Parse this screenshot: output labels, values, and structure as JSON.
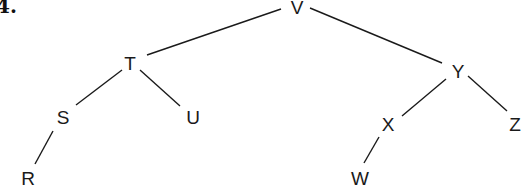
{
  "question_number": "4.",
  "tree": {
    "nodes": [
      {
        "id": "V",
        "label": "V",
        "x": 297,
        "y": 7
      },
      {
        "id": "T",
        "label": "T",
        "x": 130,
        "y": 63
      },
      {
        "id": "Y",
        "label": "Y",
        "x": 458,
        "y": 71
      },
      {
        "id": "S",
        "label": "S",
        "x": 63,
        "y": 117
      },
      {
        "id": "U",
        "label": "U",
        "x": 193,
        "y": 117
      },
      {
        "id": "X",
        "label": "X",
        "x": 388,
        "y": 124
      },
      {
        "id": "Z",
        "label": "Z",
        "x": 515,
        "y": 124
      },
      {
        "id": "R",
        "label": "R",
        "x": 28,
        "y": 178
      },
      {
        "id": "W",
        "label": "W",
        "x": 360,
        "y": 178
      }
    ],
    "edges": [
      {
        "from": "V",
        "to": "T",
        "x1": 281,
        "y1": 9,
        "x2": 147,
        "y2": 55
      },
      {
        "from": "V",
        "to": "Y",
        "x1": 310,
        "y1": 8,
        "x2": 442,
        "y2": 63
      },
      {
        "from": "T",
        "to": "S",
        "x1": 122,
        "y1": 70,
        "x2": 76,
        "y2": 105
      },
      {
        "from": "T",
        "to": "U",
        "x1": 140,
        "y1": 70,
        "x2": 180,
        "y2": 106
      },
      {
        "from": "S",
        "to": "R",
        "x1": 53,
        "y1": 131,
        "x2": 35,
        "y2": 164
      },
      {
        "from": "Y",
        "to": "X",
        "x1": 446,
        "y1": 79,
        "x2": 402,
        "y2": 116
      },
      {
        "from": "Y",
        "to": "Z",
        "x1": 468,
        "y1": 76,
        "x2": 507,
        "y2": 111
      },
      {
        "from": "X",
        "to": "W",
        "x1": 379,
        "y1": 137,
        "x2": 364,
        "y2": 163
      }
    ]
  }
}
